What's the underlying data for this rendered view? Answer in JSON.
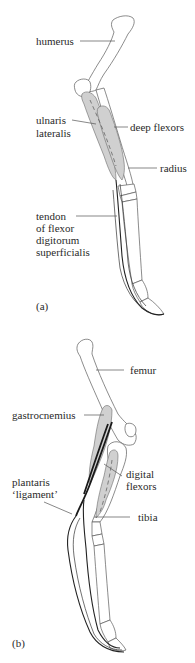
{
  "panels": [
    {
      "id": "a",
      "panel_label": "(a)",
      "labels": {
        "humerus": "humerus",
        "ulnaris_line1": "ulnaris",
        "ulnaris_line2": "lateralis",
        "deep_flexors": "deep flexors",
        "radius": "radius",
        "tendon_line1": "tendon",
        "tendon_line2": "of flexor",
        "tendon_line3": "digitorum",
        "tendon_line4": "superficialis"
      }
    },
    {
      "id": "b",
      "panel_label": "(b)",
      "labels": {
        "femur": "femur",
        "gastrocnemius": "gastrocnemius",
        "digital_line1": "digital",
        "digital_line2": "flexors",
        "plantaris_line1": "plantaris",
        "plantaris_line2": "‘ligament’",
        "tibia": "tibia"
      }
    }
  ],
  "colors": {
    "muscle_fill": "#d0d0d0",
    "bone_outline": "#5a5a5a",
    "tendon": "#222222",
    "text": "#2a2a2a"
  }
}
